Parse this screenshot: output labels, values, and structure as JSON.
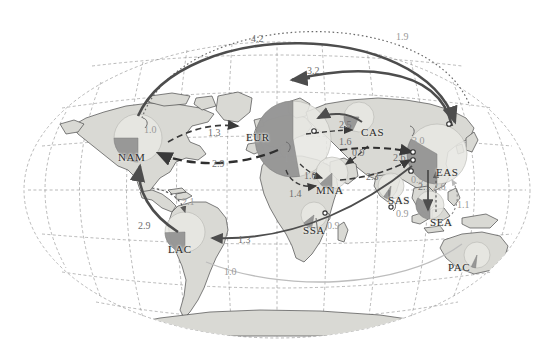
{
  "figure": {
    "type": "map-flow-diagram",
    "projection": "Robinson-like world projection with dashed graticule",
    "colors": {
      "land": "#d9d9d4",
      "land_stroke": "#4a4a4a",
      "ocean": "#ffffff",
      "graticule": "#8c8c8c",
      "pie_light": "#e7e7e2",
      "pie_dark": "#8f8f8f",
      "arrow_solid": "#4d4d4d",
      "arrow_dashed": "#3a3a3a",
      "arrow_dotted": "#5a5a5a",
      "arrow_faint": "#b9b9b9",
      "label_text": "#2b2b2b",
      "value_text": "#6e6e6e"
    }
  },
  "regions": [
    {
      "code": "NAM",
      "name": "North America",
      "x": 118,
      "y": 151,
      "pie_cx": 138,
      "pie_cy": 138,
      "pie_r": 24,
      "wedge_start": 180,
      "wedge_end": 270,
      "wedge_frac": 0.25
    },
    {
      "code": "LAC",
      "name": "Latin America and the Caribbean",
      "x": 168,
      "y": 243,
      "pie_cx": 185,
      "pie_cy": 232,
      "pie_r": 20,
      "wedge_start": 180,
      "wedge_end": 268,
      "wedge_frac": 0.24
    },
    {
      "code": "EUR",
      "name": "Europe",
      "x": 246,
      "y": 131,
      "pie_cx": 293,
      "pie_cy": 139,
      "pie_r": 38,
      "wedge_start": 170,
      "wedge_end": 360,
      "wedge_frac": 0.53
    },
    {
      "code": "MNA",
      "name": "Middle East and North Africa",
      "x": 316,
      "y": 184,
      "pie_cx": 332,
      "pie_cy": 173,
      "pie_r": 16,
      "wedge_start": 180,
      "wedge_end": 228,
      "wedge_frac": 0.13
    },
    {
      "code": "CAS",
      "name": "Central Asia",
      "x": 361,
      "y": 126,
      "pie_cx": 359,
      "pie_cy": 117,
      "pie_r": 15,
      "wedge_start": 205,
      "wedge_end": 272,
      "wedge_frac": 0.19
    },
    {
      "code": "SSA",
      "name": "Sub-Saharan Africa",
      "x": 303,
      "y": 224,
      "pie_cx": 314,
      "pie_cy": 215,
      "pie_r": 13,
      "wedge_start": 190,
      "wedge_end": 232,
      "wedge_frac": 0.12
    },
    {
      "code": "SAS",
      "name": "South Asia",
      "x": 388,
      "y": 194,
      "pie_cx": 391,
      "pie_cy": 186,
      "pie_r": 13,
      "wedge_start": 186,
      "wedge_end": 214,
      "wedge_frac": 0.08
    },
    {
      "code": "EAS",
      "name": "East Asia",
      "x": 436,
      "y": 166,
      "pie_cx": 437,
      "pie_cy": 154,
      "pie_r": 30,
      "wedge_start": 180,
      "wedge_end": 300,
      "wedge_frac": 0.33
    },
    {
      "code": "SEA",
      "name": "South-East Asia",
      "x": 430,
      "y": 216,
      "pie_cx": 430,
      "pie_cy": 205,
      "pie_r": 14,
      "wedge_start": 180,
      "wedge_end": 300,
      "wedge_frac": 0.33
    },
    {
      "code": "PAC",
      "name": "Pacific / Oceania",
      "x": 448,
      "y": 261,
      "pie_cx": 477,
      "pie_cy": 255,
      "pie_r": 13,
      "wedge_start": 186,
      "wedge_end": 206,
      "wedge_frac": 0.06
    }
  ],
  "flows": [
    {
      "id": "eas-nam",
      "label": "4.2",
      "from": "EAS",
      "to": "NAM",
      "style": "solid-heavy",
      "lx": 251,
      "ly": 33,
      "tone": "value"
    },
    {
      "id": "sea-nam",
      "label": "1.9",
      "from": "SEA",
      "to": "NAM",
      "style": "dotted",
      "lx": 396,
      "ly": 31,
      "tone": "faint"
    },
    {
      "id": "eas-eur",
      "label": "3.2",
      "from": "EAS",
      "to": "EUR",
      "style": "solid-heavy",
      "lx": 307,
      "ly": 65,
      "tone": "value"
    },
    {
      "id": "nam-eur",
      "label": "1.3",
      "from": "NAM",
      "to": "EUR",
      "style": "dashed",
      "lx": 208,
      "ly": 127,
      "tone": "value"
    },
    {
      "id": "eur-nam",
      "label": "2.9",
      "from": "EUR",
      "to": "NAM",
      "style": "dashed-heavy",
      "lx": 212,
      "ly": 158,
      "tone": "value"
    },
    {
      "id": "cas-eur",
      "label": "2.5",
      "from": "CAS",
      "to": "EUR",
      "style": "solid",
      "lx": 339,
      "ly": 119,
      "tone": "value"
    },
    {
      "id": "eur-cas",
      "label": "1.6",
      "from": "EUR",
      "to": "CAS",
      "style": "dashed",
      "lx": 339,
      "ly": 136,
      "tone": "value"
    },
    {
      "id": "eur-mna",
      "label": "1.0",
      "from": "EUR",
      "to": "MNA",
      "style": "dashed",
      "lx": 304,
      "ly": 170,
      "tone": "value"
    },
    {
      "id": "ssa-mna",
      "label": "1.4",
      "from": "SSA",
      "to": "MNA",
      "style": "dashed",
      "lx": 289,
      "ly": 188,
      "tone": "value"
    },
    {
      "id": "cas-mna",
      "label": "0.9",
      "from": "CAS",
      "to": "MNA",
      "style": "dashed",
      "lx": 352,
      "ly": 147,
      "tone": "value"
    },
    {
      "id": "cas-eas",
      "label": "2.6",
      "from": "CAS",
      "to": "EAS",
      "style": "dashed-heavy",
      "lx": 393,
      "ly": 152,
      "tone": "value"
    },
    {
      "id": "mna-eas",
      "label": "2.3",
      "from": "MNA",
      "to": "EAS",
      "style": "dashed",
      "lx": 366,
      "ly": 171,
      "tone": "value"
    },
    {
      "id": "eas-lac",
      "label": "1.3",
      "from": "EAS",
      "to": "LAC",
      "style": "solid",
      "lx": 238,
      "ly": 234,
      "tone": "value"
    },
    {
      "id": "lac-nam",
      "label": "2.9",
      "from": "LAC",
      "to": "NAM",
      "style": "solid-heavy",
      "lx": 138,
      "ly": 220,
      "tone": "value"
    },
    {
      "id": "car-lac",
      "label": "2.1",
      "from": "NAM",
      "to": "LAC",
      "style": "dotted",
      "lx": 182,
      "ly": 196,
      "tone": "faint"
    },
    {
      "id": "pac-lac",
      "label": "1.0",
      "from": "PAC",
      "to": "LAC",
      "style": "faint",
      "lx": 224,
      "ly": 266,
      "tone": "faint"
    },
    {
      "id": "sea-eas",
      "label": "1.1",
      "from": "SEA",
      "to": "EAS",
      "style": "dotted",
      "lx": 457,
      "ly": 199,
      "tone": "faint"
    },
    {
      "id": "eas-sea",
      "label": "2.1",
      "from": "EAS",
      "to": "SEA",
      "style": "solid",
      "lx": 418,
      "ly": 181,
      "tone": "value"
    },
    {
      "id": "sea-eas2",
      "label": "2.6",
      "from": "SEA",
      "to": "EAS",
      "style": "dotted",
      "lx": 433,
      "ly": 181,
      "tone": "faint"
    },
    {
      "id": "sas-eas",
      "label": "0.9",
      "from": "SAS",
      "to": "EAS",
      "style": "dotted",
      "lx": 411,
      "ly": 174,
      "tone": "faint"
    },
    {
      "id": "nam-nam",
      "label": "1.0",
      "from": "NAM",
      "to": "NAM",
      "style": "self",
      "lx": 144,
      "ly": 124,
      "tone": "faint"
    },
    {
      "id": "eur-eur",
      "label": "1.4",
      "from": "EUR",
      "to": "EUR",
      "style": "self",
      "lx": 284,
      "ly": 153,
      "tone": "faint"
    },
    {
      "id": "cas-cas",
      "label": "3.0",
      "from": "CAS",
      "to": "CAS",
      "style": "self",
      "lx": 412,
      "ly": 135,
      "tone": "faint"
    },
    {
      "id": "ssa-ssa",
      "label": "0.9",
      "from": "SSA",
      "to": "SSA",
      "style": "self",
      "lx": 327,
      "ly": 220,
      "tone": "faint"
    },
    {
      "id": "sas-sas",
      "label": "0.9",
      "from": "SAS",
      "to": "SAS",
      "style": "self",
      "lx": 396,
      "ly": 208,
      "tone": "faint"
    }
  ]
}
